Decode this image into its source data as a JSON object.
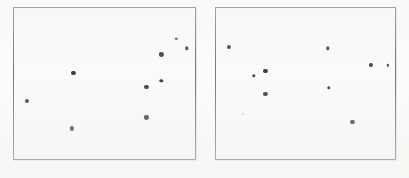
{
  "figure": {
    "title": "",
    "background_color": "#fdfdfc",
    "width": 409,
    "height": 178
  },
  "panels": [
    {
      "name": "left-panel",
      "label": "",
      "frame": {
        "x": 13,
        "y": 7,
        "width": 183,
        "height": 153
      },
      "border_color": "#4b4b4b",
      "plot_background": "#fbfbfa",
      "point_count": 9
    },
    {
      "name": "right-panel",
      "label": "",
      "frame": {
        "x": 215,
        "y": 7,
        "width": 181,
        "height": 153
      },
      "border_color": "#4b4b4b",
      "plot_background": "#fbfbfa",
      "point_count": 10
    }
  ],
  "chart_data": [
    {
      "type": "scatter",
      "title": "",
      "subtitle": "",
      "xlabel": "",
      "ylabel": "",
      "panel": "left-panel",
      "grid": false,
      "legend": null,
      "xlim": [
        0,
        100
      ],
      "ylim": [
        0,
        100
      ],
      "axis_ticks": {
        "x": [],
        "y": []
      },
      "marker_color": "#000000",
      "marker_shape": "filled-circle",
      "points": [
        {
          "x": 7.1,
          "y": 38.6,
          "size": "lg"
        },
        {
          "x": 32.8,
          "y": 56.9,
          "size": "lg"
        },
        {
          "x": 32.2,
          "y": 20.3,
          "size": "lg"
        },
        {
          "x": 73.2,
          "y": 47.7,
          "size": "lg"
        },
        {
          "x": 73.2,
          "y": 27.5,
          "size": "lg"
        },
        {
          "x": 81.4,
          "y": 69.3,
          "size": "lg"
        },
        {
          "x": 81.4,
          "y": 51.6,
          "size": "md"
        },
        {
          "x": 89.6,
          "y": 79.7,
          "size": "sm"
        },
        {
          "x": 95.6,
          "y": 73.2,
          "size": "md"
        }
      ]
    },
    {
      "type": "scatter",
      "title": "",
      "subtitle": "",
      "xlabel": "",
      "ylabel": "",
      "panel": "right-panel",
      "grid": false,
      "legend": null,
      "xlim": [
        0,
        100
      ],
      "ylim": [
        0,
        100
      ],
      "axis_ticks": {
        "x": [],
        "y": []
      },
      "marker_color": "#000000",
      "marker_shape": "filled-circle",
      "points": [
        {
          "x": 7.2,
          "y": 74.5,
          "size": "lg"
        },
        {
          "x": 21.0,
          "y": 54.9,
          "size": "md"
        },
        {
          "x": 27.6,
          "y": 58.2,
          "size": "lg"
        },
        {
          "x": 27.6,
          "y": 43.1,
          "size": "lg"
        },
        {
          "x": 14.9,
          "y": 30.1,
          "size": "faint"
        },
        {
          "x": 62.4,
          "y": 73.2,
          "size": "md"
        },
        {
          "x": 63.0,
          "y": 47.1,
          "size": "md"
        },
        {
          "x": 86.7,
          "y": 62.1,
          "size": "lg"
        },
        {
          "x": 76.2,
          "y": 24.8,
          "size": "lg"
        },
        {
          "x": 96.1,
          "y": 62.1,
          "size": "sm"
        }
      ]
    }
  ]
}
